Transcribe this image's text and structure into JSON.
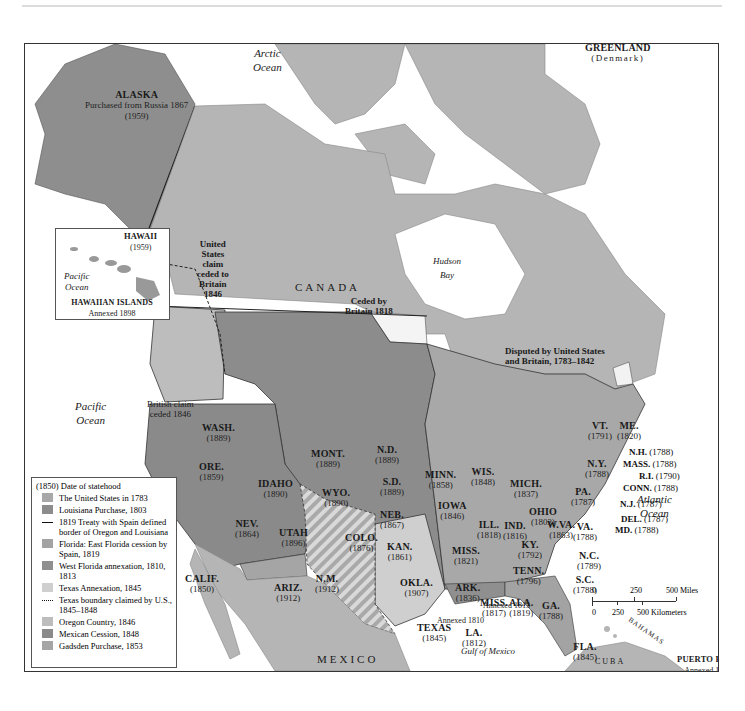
{
  "map": {
    "title_region": "North America territorial expansion of the United States",
    "colors": {
      "water": "#ffffff",
      "foreign_land": "#b5b5b5",
      "us1783": "#a8a8a8",
      "louisiana": "#8c8c8c",
      "florida_east": "#a9a9a9",
      "west_florida": "#8f8f8f",
      "texas": "#c9c9c9",
      "oregon": "#bdbdbd",
      "mexican_cession": "#8a8a8a",
      "gadsden": "#a5a5a5",
      "alaska": "#8e8e8e",
      "ceded_1818": "#f4f4f4",
      "border": "#333333"
    },
    "oceans": {
      "arctic": "Arctic\nOcean",
      "pacific": "Pacific\nOcean",
      "atlantic": "Atlantic\nOcean",
      "hudson": "Hudson\nBay",
      "gulf": "Gulf of Mexico"
    },
    "countries": {
      "canada": "CANADA",
      "mexico": "MEXICO",
      "greenland": "GREENLAND",
      "greenland_sub": "(Denmark)",
      "cuba": "CUBA",
      "bahamas": "BAHAMAS"
    },
    "annotations": {
      "alaska_title": "ALASKA",
      "alaska_sub": "Purchased from Russia 1867",
      "alaska_year": "(1959)",
      "us_claim_ceded": "United\nStates\nclaim\nceded to\nBritain\n1846",
      "british_claim": "British claim\nceded 1846",
      "ceded_by_britain": "Ceded by\nBritain 1818",
      "disputed": "Disputed by United States\nand Britain, 1783–1842",
      "annexed_1810": "Annexed 1810",
      "annexed_1813": "Annexed 1813",
      "puerto_rico": "PUERTO RICO",
      "puerto_rico_sub": "Annexed 1898"
    },
    "hawaii_inset": {
      "title": "HAWAII",
      "year": "(1959)",
      "ocean": "Pacific\nOcean",
      "islands": "HAWAIIAN ISLANDS",
      "annexed": "Annexed 1898"
    },
    "states": [
      {
        "abbr": "WASH.",
        "year": "(1889)"
      },
      {
        "abbr": "ORE.",
        "year": "(1859)"
      },
      {
        "abbr": "CALIF.",
        "year": "(1850)"
      },
      {
        "abbr": "NEV.",
        "year": "(1864)"
      },
      {
        "abbr": "IDAHO",
        "year": "(1890)"
      },
      {
        "abbr": "MONT.",
        "year": "(1889)"
      },
      {
        "abbr": "WYO.",
        "year": "(1890)"
      },
      {
        "abbr": "UTAH",
        "year": "(1896)"
      },
      {
        "abbr": "ARIZ.",
        "year": "(1912)"
      },
      {
        "abbr": "N.M.",
        "year": "(1912)"
      },
      {
        "abbr": "COLO.",
        "year": "(1876)"
      },
      {
        "abbr": "N.D.",
        "year": "(1889)"
      },
      {
        "abbr": "S.D.",
        "year": "(1889)"
      },
      {
        "abbr": "NEB.",
        "year": "(1867)"
      },
      {
        "abbr": "KAN.",
        "year": "(1861)"
      },
      {
        "abbr": "OKLA.",
        "year": "(1907)"
      },
      {
        "abbr": "TEXAS",
        "year": "(1845)"
      },
      {
        "abbr": "MINN.",
        "year": "(1858)"
      },
      {
        "abbr": "IOWA",
        "year": "(1846)"
      },
      {
        "abbr": "MISS.",
        "year": "(1821)"
      },
      {
        "abbr": "ARK.",
        "year": "(1836)"
      },
      {
        "abbr": "LA.",
        "year": "(1812)"
      },
      {
        "abbr": "WIS.",
        "year": "(1848)"
      },
      {
        "abbr": "ILL.",
        "year": "(1818)"
      },
      {
        "abbr": "MICH.",
        "year": "(1837)"
      },
      {
        "abbr": "IND.",
        "year": "(1816)"
      },
      {
        "abbr": "OHIO",
        "year": "(1803)"
      },
      {
        "abbr": "KY.",
        "year": "(1792)"
      },
      {
        "abbr": "TENN.",
        "year": "(1796)"
      },
      {
        "abbr": "MISS.",
        "year": "(1817)"
      },
      {
        "abbr": "ALA.",
        "year": "(1819)"
      },
      {
        "abbr": "GA.",
        "year": "(1788)"
      },
      {
        "abbr": "FLA.",
        "year": "(1845)"
      },
      {
        "abbr": "S.C.",
        "year": "(1788)"
      },
      {
        "abbr": "N.C.",
        "year": "(1789)"
      },
      {
        "abbr": "VA.",
        "year": "(1788)"
      },
      {
        "abbr": "W.VA.",
        "year": "(1863)"
      },
      {
        "abbr": "PA.",
        "year": "(1787)"
      },
      {
        "abbr": "N.Y.",
        "year": "(1788)"
      },
      {
        "abbr": "VT.",
        "year": "(1791)"
      },
      {
        "abbr": "ME.",
        "year": "(1820)"
      }
    ],
    "east_callouts": [
      {
        "abbr": "N.H.",
        "year": "(1788)"
      },
      {
        "abbr": "MASS.",
        "year": "(1788)"
      },
      {
        "abbr": "R.I.",
        "year": "(1790)"
      },
      {
        "abbr": "CONN.",
        "year": "(1788)"
      },
      {
        "abbr": "N.J.",
        "year": "(1787)"
      },
      {
        "abbr": "DEL.",
        "year": "(1787)"
      },
      {
        "abbr": "MD.",
        "year": "(1788)"
      }
    ],
    "scale": {
      "miles": [
        "0",
        "250",
        "500 Miles"
      ],
      "km": [
        "0",
        "250",
        "500 Kilometers"
      ]
    }
  },
  "legend": {
    "title": "(1850)  Date of statehood",
    "items": [
      {
        "label": "The United States in 1783",
        "type": "swatch",
        "color": "#a8a8a8"
      },
      {
        "label": "Louisiana Purchase, 1803",
        "type": "swatch",
        "color": "#8c8c8c"
      },
      {
        "label": "1819 Treaty with Spain defined border of Oregon and Louisiana",
        "type": "line"
      },
      {
        "label": "Florida: East Florida cession by Spain, 1819",
        "type": "swatch",
        "color": "#a3a3a3"
      },
      {
        "label": "West Florida annexation, 1810, 1813",
        "type": "swatch",
        "color": "#8f8f8f"
      },
      {
        "label": "Texas Annexation, 1845",
        "type": "swatch",
        "color": "#cfcfcf"
      },
      {
        "label": "Texas boundary claimed by U.S., 1845–1848",
        "type": "dots"
      },
      {
        "label": "Oregon Country, 1846",
        "type": "swatch",
        "color": "#bdbdbd"
      },
      {
        "label": "Mexican Cession, 1848",
        "type": "swatch",
        "color": "#8a8a8a"
      },
      {
        "label": "Gadsden Purchase, 1853",
        "type": "swatch",
        "color": "#a5a5a5"
      }
    ]
  }
}
